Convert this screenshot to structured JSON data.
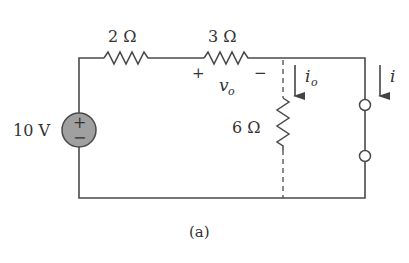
{
  "diagram": {
    "type": "circuit",
    "caption": "(a)",
    "source": {
      "label": "10 V",
      "plus": "+",
      "minus": "−",
      "fill": "#a0a0a0"
    },
    "resistors": [
      {
        "id": "r1",
        "label": "2 Ω"
      },
      {
        "id": "r2",
        "label": "3 Ω",
        "voltage_label": "v",
        "voltage_sub": "o",
        "plus": "+",
        "minus": "−"
      },
      {
        "id": "r3",
        "label": "6 Ω"
      }
    ],
    "currents": [
      {
        "id": "io",
        "label": "i",
        "sub": "o"
      },
      {
        "id": "i",
        "label": "i"
      }
    ],
    "colors": {
      "wire": "#4a4a4a",
      "text": "#333333",
      "source_fill": "#a0a0a0"
    }
  }
}
